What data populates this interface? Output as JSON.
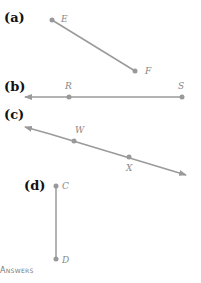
{
  "colors": {
    "line": "#9a9a9a",
    "point": "#999999",
    "label": "#888888"
  },
  "figures": [
    {
      "label": "(a)",
      "type": "segment",
      "points": [
        {
          "name": "E",
          "x": 52,
          "y": 20
        },
        {
          "name": "F",
          "x": 135,
          "y": 71
        }
      ]
    },
    {
      "label": "(b)",
      "type": "ray",
      "points": [
        {
          "name": "R",
          "x": 69,
          "y": 97
        },
        {
          "name": "S",
          "x": 182,
          "y": 97
        }
      ]
    },
    {
      "label": "(c)",
      "type": "line",
      "points": [
        {
          "name": "W",
          "x": 74,
          "y": 141
        },
        {
          "name": "X",
          "x": 129,
          "y": 157
        }
      ]
    },
    {
      "label": "(d)",
      "type": "segment",
      "points": [
        {
          "name": "C",
          "x": 56,
          "y": 186
        },
        {
          "name": "D",
          "x": 56,
          "y": 259
        }
      ]
    }
  ],
  "footer": {
    "answers_label": "Answers"
  }
}
